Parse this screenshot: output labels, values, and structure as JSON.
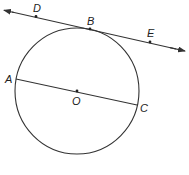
{
  "diagram": {
    "type": "circle-with-tangent-line-and-diameter",
    "labels": {
      "D": "D",
      "B": "B",
      "E": "E",
      "A": "A",
      "O": "O",
      "C": "C"
    },
    "circle": {
      "center": "O",
      "cx": 77,
      "cy": 91,
      "r": 62
    },
    "tangent_line": {
      "points": [
        "D",
        "B",
        "E"
      ],
      "tangent_point": "B",
      "arrows": "both"
    },
    "diameter": {
      "endpoints": [
        "A",
        "C"
      ],
      "through": "O"
    },
    "stroke_color": "#333333"
  }
}
